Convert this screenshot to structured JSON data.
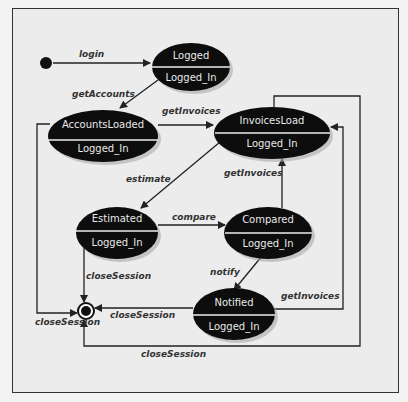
{
  "diagram": {
    "type": "uml-state-machine",
    "states": [
      {
        "id": "logged",
        "name": "Logged",
        "substate": "Logged_In"
      },
      {
        "id": "accounts-loaded",
        "name": "AccountsLoaded",
        "substate": "Logged_In"
      },
      {
        "id": "invoices-load",
        "name": "InvoicesLoad",
        "substate": "Logged_In"
      },
      {
        "id": "estimated",
        "name": "Estimated",
        "substate": "Logged_In"
      },
      {
        "id": "compared",
        "name": "Compared",
        "substate": "Logged_In"
      },
      {
        "id": "notified",
        "name": "Notified",
        "substate": "Logged_In"
      }
    ],
    "transitions": [
      {
        "id": "login",
        "label": "login",
        "from": "initial",
        "to": "logged"
      },
      {
        "id": "get-accounts",
        "label": "getAccounts",
        "from": "logged",
        "to": "accounts-loaded"
      },
      {
        "id": "get-invoices-1",
        "label": "getInvoices",
        "from": "accounts-loaded",
        "to": "invoices-load"
      },
      {
        "id": "estimate",
        "label": "estimate",
        "from": "invoices-load",
        "to": "estimated"
      },
      {
        "id": "compare",
        "label": "compare",
        "from": "estimated",
        "to": "compared"
      },
      {
        "id": "get-invoices-2",
        "label": "getInvoices",
        "from": "compared",
        "to": "invoices-load"
      },
      {
        "id": "notify",
        "label": "notify",
        "from": "compared",
        "to": "notified"
      },
      {
        "id": "get-invoices-3",
        "label": "getInvoices",
        "from": "notified",
        "to": "invoices-load"
      },
      {
        "id": "close-session-estimated",
        "label": "closeSession",
        "from": "estimated",
        "to": "final"
      },
      {
        "id": "close-session-accounts",
        "label": "closeSession",
        "from": "accounts-loaded",
        "to": "final"
      },
      {
        "id": "close-session-notified",
        "label": "closeSession",
        "from": "notified",
        "to": "final"
      },
      {
        "id": "close-session-invoices",
        "label": "closeSession",
        "from": "invoices-load",
        "to": "final"
      }
    ]
  }
}
